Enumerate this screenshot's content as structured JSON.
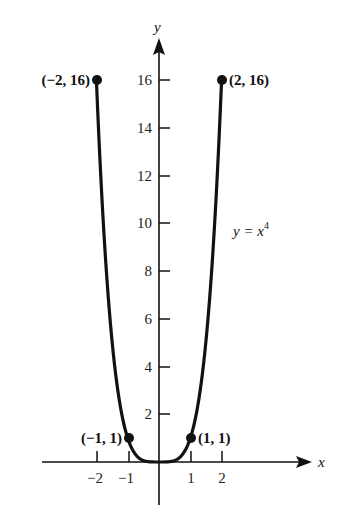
{
  "chart_data": {
    "type": "line",
    "title": "",
    "xlabel": "x",
    "ylabel": "y",
    "series": [
      {
        "name": "y = x^4",
        "function": "x^4",
        "x": [
          -2,
          -1.5,
          -1,
          -0.5,
          0,
          0.5,
          1,
          1.5,
          2
        ],
        "y": [
          16,
          5.0625,
          1,
          0.0625,
          0,
          0.0625,
          1,
          5.0625,
          16
        ]
      }
    ],
    "labeled_points": [
      {
        "x": -2,
        "y": 16,
        "label": "(−2, 16)"
      },
      {
        "x": 2,
        "y": 16,
        "label": "(2, 16)"
      },
      {
        "x": -1,
        "y": 1,
        "label": "(−1, 1)"
      },
      {
        "x": 1,
        "y": 1,
        "label": "(1, 1)"
      }
    ],
    "x_ticks": [
      "−2",
      "−1",
      "1",
      "2"
    ],
    "y_ticks": [
      "2",
      "4",
      "6",
      "8",
      "10",
      "12",
      "14",
      "16"
    ],
    "annotation": "y = x⁴",
    "xlim": [
      -3,
      4.5
    ],
    "ylim": [
      -2.5,
      18
    ],
    "grid": false,
    "legend": "none"
  },
  "labels": {
    "x_axis": "x",
    "y_axis": "y",
    "equation_prefix": "y = x",
    "equation_exp": "4",
    "pt_m2": "(−2, 16)",
    "pt_p2": "(2, 16)",
    "pt_m1": "(−1, 1)",
    "pt_p1": "(1, 1)",
    "xt": [
      "−2",
      "−1",
      "1",
      "2"
    ],
    "yt": [
      "2",
      "4",
      "6",
      "8",
      "10",
      "12",
      "14",
      "16"
    ]
  }
}
